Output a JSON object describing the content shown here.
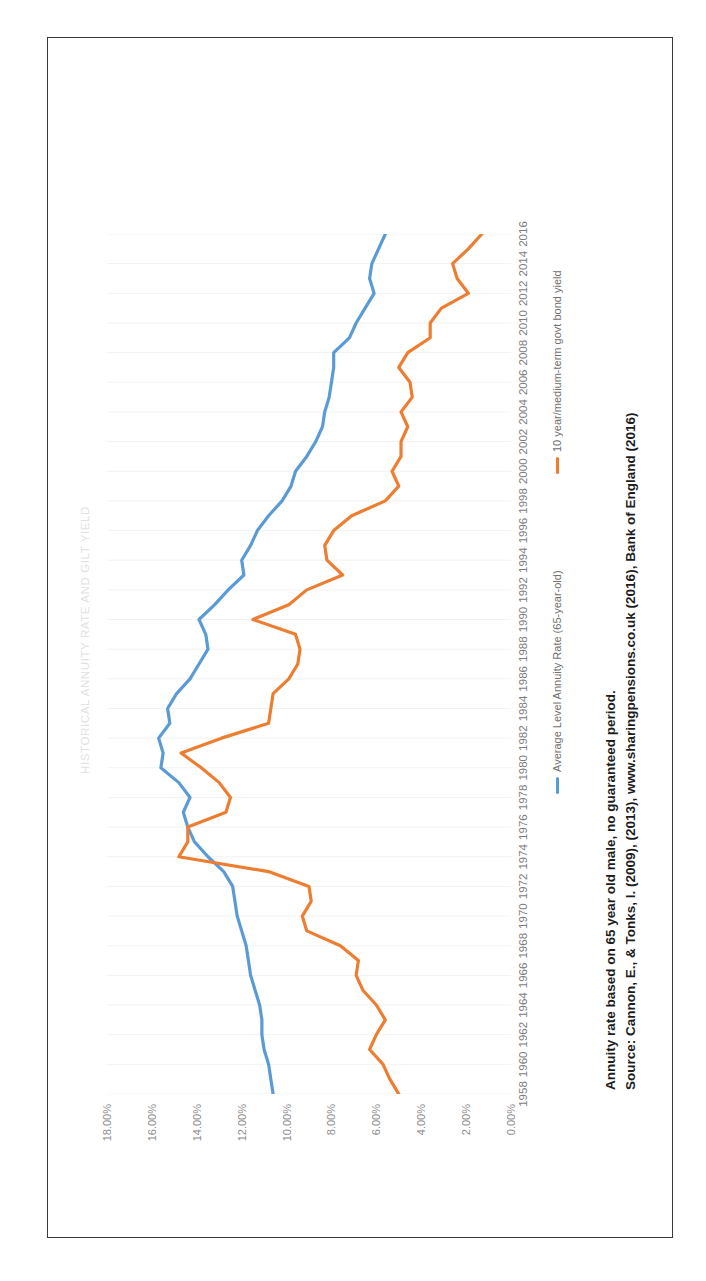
{
  "document": {
    "border_color": "#3a3a3a",
    "background": "#ffffff"
  },
  "footnote": {
    "line1": "Annuity rate based on 65 year old male, no guaranteed period.",
    "line2": "Source: Cannon, E., & Tonks, I. (2009), (2013), www.sharingpensions.co.uk (2016), Bank of England (2016)"
  },
  "chart_data": {
    "type": "line",
    "title": "HISTORICAL ANNUITY RATE AND GILT YIELD",
    "xlabel": "",
    "ylabel": "",
    "ylim": [
      0,
      18
    ],
    "ytick_labels": [
      "0.00%",
      "2.00%",
      "4.00%",
      "6.00%",
      "8.00%",
      "10.00%",
      "12.00%",
      "14.00%",
      "16.00%",
      "18.00%"
    ],
    "ytick_values": [
      0,
      2,
      4,
      6,
      8,
      10,
      12,
      14,
      16,
      18
    ],
    "grid": "vertical-light",
    "legend_position": "bottom",
    "rotation_degrees": -90,
    "xtick_labels": [
      "1958",
      "1960",
      "1962",
      "1964",
      "1966",
      "1968",
      "1970",
      "1972",
      "1974",
      "1976",
      "1978",
      "1980",
      "1982",
      "1984",
      "1986",
      "1988",
      "1990",
      "1992",
      "1994",
      "1996",
      "1998",
      "2000",
      "2002",
      "2004",
      "2006",
      "2008",
      "2010",
      "2012",
      "2014",
      "2016"
    ],
    "x": [
      1958,
      1959,
      1960,
      1961,
      1962,
      1963,
      1964,
      1965,
      1966,
      1967,
      1968,
      1969,
      1970,
      1971,
      1972,
      1973,
      1974,
      1975,
      1976,
      1977,
      1978,
      1979,
      1980,
      1981,
      1982,
      1983,
      1984,
      1985,
      1986,
      1987,
      1988,
      1989,
      1990,
      1991,
      1992,
      1993,
      1994,
      1995,
      1996,
      1997,
      1998,
      1999,
      2000,
      2001,
      2002,
      2003,
      2004,
      2005,
      2006,
      2007,
      2008,
      2009,
      2010,
      2011,
      2012,
      2013,
      2014,
      2015,
      2016
    ],
    "series": [
      {
        "name": "Average Level Annuity Rate (65-year-old)",
        "color": "#5B9BD5",
        "values": [
          10.6,
          10.7,
          10.8,
          11.0,
          11.1,
          11.1,
          11.2,
          11.4,
          11.6,
          11.7,
          11.8,
          12.0,
          12.2,
          12.3,
          12.4,
          12.8,
          13.5,
          14.1,
          14.4,
          14.6,
          14.3,
          14.8,
          15.6,
          15.5,
          15.7,
          15.2,
          15.3,
          14.9,
          14.3,
          13.9,
          13.5,
          13.6,
          13.9,
          13.2,
          12.6,
          11.9,
          12.0,
          11.6,
          11.3,
          10.8,
          10.2,
          9.8,
          9.6,
          9.1,
          8.7,
          8.4,
          8.3,
          8.1,
          8.0,
          7.9,
          7.9,
          7.2,
          6.9,
          6.5,
          6.1,
          6.3,
          6.2,
          5.9,
          5.6
        ]
      },
      {
        "name": "10 year/medium-term govt bond yield",
        "color": "#ED7D31",
        "values": [
          5.0,
          5.4,
          5.7,
          6.3,
          6.0,
          5.6,
          6.0,
          6.6,
          6.9,
          6.8,
          7.6,
          9.1,
          9.3,
          8.9,
          9.0,
          10.8,
          14.8,
          14.4,
          14.4,
          12.7,
          12.5,
          13.0,
          13.8,
          14.7,
          12.9,
          10.8,
          10.7,
          10.6,
          9.9,
          9.5,
          9.4,
          9.6,
          11.5,
          9.9,
          9.1,
          7.5,
          8.2,
          8.3,
          7.9,
          7.1,
          5.6,
          5.0,
          5.3,
          4.9,
          4.9,
          4.6,
          4.9,
          4.4,
          4.5,
          5.0,
          4.6,
          3.6,
          3.6,
          3.1,
          1.9,
          2.4,
          2.6,
          1.9,
          1.3
        ]
      }
    ]
  }
}
